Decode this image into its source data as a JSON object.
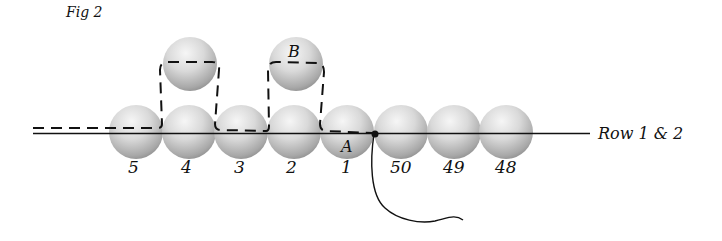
{
  "figure": {
    "title": "Fig 2",
    "row_label": "Row 1 & 2",
    "point_labels": {
      "a": "A",
      "b": "B"
    },
    "row_beads": [
      {
        "label": "5",
        "cx": 136
      },
      {
        "label": "4",
        "cx": 189
      },
      {
        "label": "3",
        "cx": 241
      },
      {
        "label": "2",
        "cx": 294
      },
      {
        "label": "1",
        "cx": 347
      },
      {
        "label": "50",
        "cx": 401
      },
      {
        "label": "49",
        "cx": 454
      },
      {
        "label": "48",
        "cx": 506
      }
    ],
    "top_beads": [
      {
        "above": "4",
        "cx": 190
      },
      {
        "above": "2",
        "cx": 296,
        "label": "B"
      }
    ],
    "colors": {
      "bead_light": "#f4f4f4",
      "bead_mid": "#c8c8c8",
      "bead_dark": "#8e8e8e",
      "line": "#111111"
    }
  }
}
